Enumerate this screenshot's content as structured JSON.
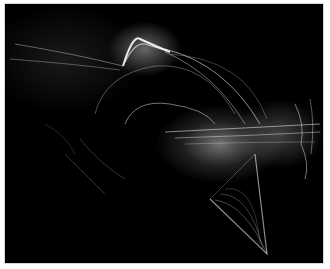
{
  "image": {
    "description": "Abstract white light-trail / fractal flame rendering on a black background",
    "background_color": "#000000",
    "border_color": "#ffffff",
    "trail_color": "#ffffff"
  }
}
